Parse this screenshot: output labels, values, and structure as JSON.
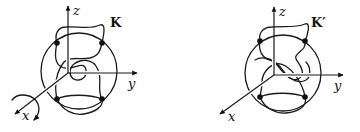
{
  "figure": {
    "panels": [
      {
        "id": "left",
        "knot_label": "K",
        "axes": {
          "z": "z",
          "y": "y",
          "x": "x"
        },
        "marked_points": 4,
        "rotation_arrow_about": "x"
      },
      {
        "id": "right",
        "knot_label": "K′",
        "axes": {
          "z": "z",
          "y": "y",
          "x": "x"
        },
        "marked_points": 4
      }
    ],
    "colors": {
      "ink": "#1a1a1a",
      "background": "#ffffff"
    }
  }
}
